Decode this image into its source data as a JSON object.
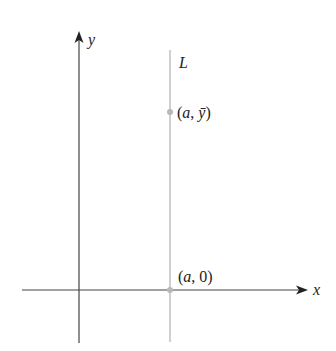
{
  "diagram": {
    "axes": {
      "x_label": "x",
      "y_label": "y",
      "color": "#3a3a3a"
    },
    "line": {
      "label": "L",
      "color": "#b0b0b0"
    },
    "points": [
      {
        "label_open": "(",
        "label_var": "a",
        "label_sep": ", ",
        "label_val": "ȳ",
        "label_close": ")",
        "color": "#b8b8b8"
      },
      {
        "label_open": "(",
        "label_var": "a",
        "label_sep": ", ",
        "label_val": "0",
        "label_close": ")",
        "color": "#b8b8b8"
      }
    ]
  }
}
